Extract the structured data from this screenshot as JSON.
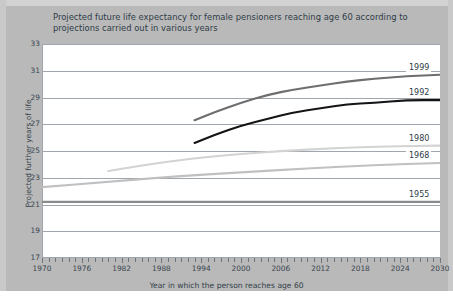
{
  "chart_data": {
    "type": "line",
    "title": "Projected future life expectancy for female pensioners reaching age 60 according to projections carried out in various years",
    "xlabel": "Year in which the person reaches age 60",
    "ylabel": "Projected further years of life",
    "xlim": [
      1970,
      2030
    ],
    "ylim": [
      17,
      33
    ],
    "xticks": [
      1970,
      1976,
      1982,
      1988,
      1994,
      2000,
      2006,
      2012,
      2018,
      2024,
      2030
    ],
    "yticks": [
      17,
      19,
      21,
      23,
      25,
      27,
      29,
      31,
      33
    ],
    "x_minor_tick_step": 1,
    "grid": "horizontal",
    "legend_position": "right-inline-labels",
    "series": [
      {
        "name": "1999",
        "color": "#6e6e6e",
        "label": "1999",
        "points": [
          {
            "x": 1993,
            "y": 27.3
          },
          {
            "x": 1996,
            "y": 27.9
          },
          {
            "x": 2000,
            "y": 28.6
          },
          {
            "x": 2004,
            "y": 29.2
          },
          {
            "x": 2008,
            "y": 29.6
          },
          {
            "x": 2012,
            "y": 29.9
          },
          {
            "x": 2016,
            "y": 30.2
          },
          {
            "x": 2020,
            "y": 30.4
          },
          {
            "x": 2025,
            "y": 30.6
          },
          {
            "x": 2030,
            "y": 30.7
          }
        ]
      },
      {
        "name": "1992",
        "color": "#141414",
        "label": "1992",
        "points": [
          {
            "x": 1993,
            "y": 25.6
          },
          {
            "x": 1996,
            "y": 26.2
          },
          {
            "x": 2000,
            "y": 26.9
          },
          {
            "x": 2004,
            "y": 27.4
          },
          {
            "x": 2008,
            "y": 27.9
          },
          {
            "x": 2012,
            "y": 28.2
          },
          {
            "x": 2016,
            "y": 28.5
          },
          {
            "x": 2020,
            "y": 28.6
          },
          {
            "x": 2025,
            "y": 28.8
          },
          {
            "x": 2030,
            "y": 28.8
          }
        ]
      },
      {
        "name": "1980",
        "color": "#d3d3d3",
        "label": "1980",
        "points": [
          {
            "x": 1980,
            "y": 23.5
          },
          {
            "x": 1986,
            "y": 24.0
          },
          {
            "x": 1992,
            "y": 24.4
          },
          {
            "x": 1998,
            "y": 24.7
          },
          {
            "x": 2006,
            "y": 25.0
          },
          {
            "x": 2014,
            "y": 25.2
          },
          {
            "x": 2022,
            "y": 25.35
          },
          {
            "x": 2030,
            "y": 25.4
          }
        ]
      },
      {
        "name": "1968",
        "color": "#c0c0c0",
        "label": "1968",
        "points": [
          {
            "x": 1970,
            "y": 22.3
          },
          {
            "x": 1980,
            "y": 22.7
          },
          {
            "x": 1990,
            "y": 23.1
          },
          {
            "x": 2000,
            "y": 23.4
          },
          {
            "x": 2010,
            "y": 23.7
          },
          {
            "x": 2020,
            "y": 23.95
          },
          {
            "x": 2030,
            "y": 24.1
          }
        ]
      },
      {
        "name": "1955",
        "color": "#8a8a8a",
        "label": "1955",
        "points": [
          {
            "x": 1970,
            "y": 21.2
          },
          {
            "x": 2000,
            "y": 21.2
          },
          {
            "x": 2030,
            "y": 21.2
          }
        ]
      }
    ]
  },
  "colors": {
    "background": "#b9b9b9",
    "plot_background": "#ffffff",
    "grid": "#9fa6ad",
    "title_text": "#2e3b47",
    "axis_text": "#3a4650"
  }
}
